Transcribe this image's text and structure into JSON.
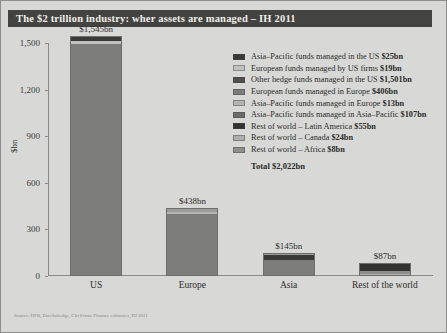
{
  "title": "The $2 trillion industry: wher assets are managed – IH 2011",
  "footnote": "Source: HFR, Eurekahedge, Citi Prime Finance estimates, IH 2011",
  "colors": {
    "background": "#d8d8d6",
    "title_bar": "#434341",
    "title_text": "#f0efe9",
    "axis": "#8a8a88",
    "text": "#2b2b29",
    "dark1": "#3a3a38",
    "dark2": "#4e4e4c",
    "mid1": "#6f6f6d",
    "mid2": "#8b8b89",
    "light1": "#a9a9a7",
    "light2": "#c0c0be",
    "main_body": "#7d7d7b"
  },
  "legend": {
    "items": [
      {
        "label": "Asia–Pacific funds managed in the US ",
        "value": "$25bn",
        "color": "#3a3a38"
      },
      {
        "label": "European funds managed by US firms ",
        "value": "$19bn",
        "color": "#c2c2c0"
      },
      {
        "label": "Other hedge funds managed in the US ",
        "value": "$1,501bn",
        "color": "#4e4e4c"
      },
      {
        "label": "European funds managed in Europe ",
        "value": "$406bn",
        "color": "#7d7d7b"
      },
      {
        "label": "Asia–Pacific funds managed in Europe ",
        "value": "$13bn",
        "color": "#b4b4b2"
      },
      {
        "label": "Asia–Pacific funds managed in Asia–Pacific ",
        "value": "$107bn",
        "color": "#6b6b69"
      },
      {
        "label": "Rest of world – Latin America ",
        "value": "$55bn",
        "color": "#33332f"
      },
      {
        "label": "Rest of world – Canada ",
        "value": "$24bn",
        "color": "#aeaeac"
      },
      {
        "label": "Rest of world – Africa ",
        "value": "$8bn",
        "color": "#8e8e8c"
      }
    ],
    "total": "Total $2,022bn"
  },
  "chart_data": {
    "type": "bar",
    "title": "The $2 trillion industry: wher assets are managed – IH 2011",
    "xlabel": "",
    "ylabel": "$bn",
    "ylim": [
      0,
      1500
    ],
    "yticks": [
      0,
      300,
      600,
      900,
      1200,
      1500
    ],
    "ytick_labels": [
      "0",
      "300",
      "600",
      "900",
      "1,200",
      "1,500"
    ],
    "grid": false,
    "legend_position": "upper right",
    "categories": [
      "US",
      "Europe",
      "Asia",
      "Rest of the world"
    ],
    "values": [
      1545,
      438,
      145,
      87
    ],
    "value_labels": [
      "$1,545bn",
      "$438bn",
      "$145bn",
      "$87bn"
    ],
    "stacked": true,
    "stacks": [
      {
        "category": "US",
        "total": 1545,
        "segments": [
          {
            "name": "Asia–Pacific funds managed in the US",
            "value": 25,
            "color": "#3a3a38"
          },
          {
            "name": "European funds managed by US firms",
            "value": 19,
            "color": "#c2c2c0"
          },
          {
            "name": "Other hedge funds managed in the US",
            "value": 1501,
            "color": "#7d7d7b"
          }
        ]
      },
      {
        "category": "Europe",
        "total": 438,
        "segments": [
          {
            "name": "Asia–Pacific funds managed in Europe",
            "value": 13,
            "color": "#b4b4b2"
          },
          {
            "name": "European funds managed in Europe",
            "value": 406,
            "color": "#7d7d7b"
          }
        ]
      },
      {
        "category": "Asia",
        "total": 145,
        "segments": [
          {
            "name": "Other",
            "value": 38,
            "color": "#3a3a38"
          },
          {
            "name": "Asia–Pacific funds managed in Asia–Pacific",
            "value": 107,
            "color": "#7d7d7b"
          }
        ]
      },
      {
        "category": "Rest of the world",
        "total": 87,
        "segments": [
          {
            "name": "Rest of world – Latin America",
            "value": 55,
            "color": "#33332f"
          },
          {
            "name": "Rest of world – Canada",
            "value": 24,
            "color": "#8e8e8c"
          },
          {
            "name": "Rest of world – Africa",
            "value": 8,
            "color": "#aeaeac"
          }
        ]
      }
    ]
  }
}
